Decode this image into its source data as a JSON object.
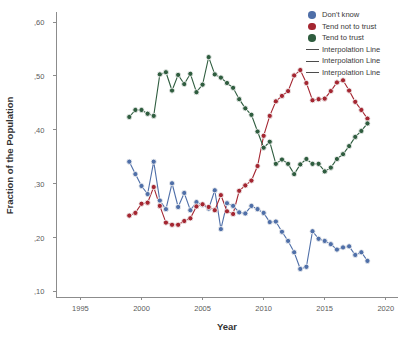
{
  "chart_data": {
    "type": "line",
    "title": "",
    "xlabel": "Year",
    "ylabel": "Fraction of the Population",
    "xlim": [
      1993,
      2021
    ],
    "ylim": [
      0.09,
      0.615
    ],
    "grid": false,
    "legend_position": "top-right",
    "x_ticks": [
      "1995",
      "2000",
      "2005",
      "2010",
      "2015",
      "2020"
    ],
    "x_tick_values": [
      1995,
      2000,
      2005,
      2010,
      2015,
      2020
    ],
    "y_ticks": [
      ",10",
      ",20",
      ",30",
      ",40",
      ",50",
      ",60"
    ],
    "y_tick_values": [
      0.1,
      0.2,
      0.3,
      0.4,
      0.5,
      0.6
    ],
    "colors": {
      "dont_know": "#4f6fa8",
      "tend_not_to_trust": "#a42631",
      "tend_to_trust": "#2f5d3f",
      "axis": "#8c8c8c",
      "text": "#4a4a4a"
    },
    "series": [
      {
        "name": "Don't know",
        "color": "#4f6fa8",
        "marker": "circle",
        "x": [
          1999.0,
          1999.5,
          2000.0,
          2000.5,
          2001.0,
          2001.5,
          2002.0,
          2002.5,
          2003.0,
          2003.5,
          2004.0,
          2004.5,
          2005.0,
          2005.5,
          2006.0,
          2006.5,
          2007.0,
          2007.5,
          2008.0,
          2008.5,
          2009.0,
          2009.5,
          2010.0,
          2010.5,
          2011.0,
          2011.5,
          2012.0,
          2012.5,
          2013.0,
          2013.5,
          2014.0,
          2014.5,
          2015.0,
          2015.5,
          2016.0,
          2016.5,
          2017.0,
          2017.5,
          2018.0,
          2018.5
        ],
        "values": [
          0.341,
          0.318,
          0.296,
          0.281,
          0.341,
          0.269,
          0.253,
          0.301,
          0.257,
          0.283,
          0.251,
          0.266,
          0.261,
          0.254,
          0.288,
          0.216,
          0.264,
          0.259,
          0.247,
          0.245,
          0.259,
          0.253,
          0.246,
          0.229,
          0.23,
          0.211,
          0.194,
          0.173,
          0.142,
          0.146,
          0.212,
          0.198,
          0.194,
          0.188,
          0.178,
          0.182,
          0.184,
          0.168,
          0.173,
          0.157
        ]
      },
      {
        "name": "Tend not to trust",
        "color": "#a42631",
        "marker": "circle",
        "x": [
          1999.0,
          1999.5,
          2000.0,
          2000.5,
          2001.0,
          2001.5,
          2002.0,
          2002.5,
          2003.0,
          2003.5,
          2004.0,
          2004.5,
          2005.0,
          2005.5,
          2006.0,
          2006.5,
          2007.0,
          2007.5,
          2008.0,
          2008.5,
          2009.0,
          2009.5,
          2010.0,
          2010.5,
          2011.0,
          2011.5,
          2012.0,
          2012.5,
          2013.0,
          2013.5,
          2014.0,
          2014.5,
          2015.0,
          2015.5,
          2016.0,
          2016.5,
          2017.0,
          2017.5,
          2018.0,
          2018.5
        ],
        "values": [
          0.241,
          0.246,
          0.263,
          0.265,
          0.294,
          0.259,
          0.228,
          0.224,
          0.224,
          0.231,
          0.236,
          0.258,
          0.262,
          0.257,
          0.251,
          0.279,
          0.249,
          0.244,
          0.287,
          0.297,
          0.306,
          0.333,
          0.389,
          0.426,
          0.453,
          0.463,
          0.472,
          0.501,
          0.511,
          0.487,
          0.455,
          0.457,
          0.458,
          0.472,
          0.488,
          0.492,
          0.473,
          0.452,
          0.437,
          0.421
        ]
      },
      {
        "name": "Tend to trust",
        "color": "#2f5d3f",
        "marker": "circle",
        "x": [
          1999.0,
          1999.5,
          2000.0,
          2000.5,
          2001.0,
          2001.5,
          2002.0,
          2002.5,
          2003.0,
          2003.5,
          2004.0,
          2004.5,
          2005.0,
          2005.5,
          2006.0,
          2006.5,
          2007.0,
          2007.5,
          2008.0,
          2008.5,
          2009.0,
          2009.5,
          2010.0,
          2010.5,
          2011.0,
          2011.5,
          2012.0,
          2012.5,
          2013.0,
          2013.5,
          2014.0,
          2014.5,
          2015.0,
          2015.5,
          2016.0,
          2016.5,
          2017.0,
          2017.5,
          2018.0,
          2018.5
        ],
        "values": [
          0.424,
          0.437,
          0.437,
          0.43,
          0.426,
          0.503,
          0.507,
          0.473,
          0.502,
          0.485,
          0.504,
          0.47,
          0.484,
          0.535,
          0.503,
          0.497,
          0.487,
          0.478,
          0.457,
          0.44,
          0.428,
          0.397,
          0.367,
          0.378,
          0.337,
          0.345,
          0.337,
          0.318,
          0.336,
          0.346,
          0.337,
          0.337,
          0.323,
          0.33,
          0.346,
          0.355,
          0.37,
          0.387,
          0.398,
          0.412
        ]
      }
    ],
    "legend": [
      {
        "label": "Don't know",
        "type": "marker",
        "color": "#4f6fa8"
      },
      {
        "label": "Tend not to trust",
        "type": "marker",
        "color": "#a42631"
      },
      {
        "label": "Tend to trust",
        "type": "marker",
        "color": "#2f5d3f"
      },
      {
        "label": "Interpolation Line",
        "type": "line",
        "color": "#4c4c4c"
      },
      {
        "label": "Interpolation Line",
        "type": "line",
        "color": "#4c4c4c"
      },
      {
        "label": "Interpolation Line",
        "type": "line",
        "color": "#4c4c4c"
      }
    ]
  }
}
